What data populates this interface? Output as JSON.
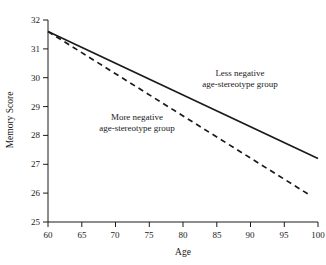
{
  "chart_data": {
    "type": "line",
    "title": "",
    "xlabel": "Age",
    "ylabel": "Memory Score",
    "xlim": [
      60,
      100
    ],
    "ylim": [
      25,
      32
    ],
    "xticks": [
      60,
      65,
      70,
      75,
      80,
      85,
      90,
      95,
      100
    ],
    "xtick_labels": [
      "60",
      "65",
      "70",
      "75",
      "80",
      "85",
      "90",
      "95",
      "100"
    ],
    "yticks": [
      25,
      26,
      27,
      28,
      29,
      30,
      31,
      32
    ],
    "ytick_labels": [
      "25",
      "26",
      "27",
      "28",
      "29",
      "30",
      "31",
      "32"
    ],
    "grid": false,
    "legend_position": "inline-annotation",
    "series": [
      {
        "name": "Less negative age-stereotype group",
        "label_line1": "Less negative",
        "label_line2": "age-stereotype group",
        "style": "solid",
        "color": "#1a1a1a",
        "x": [
          60,
          100
        ],
        "values": [
          31.6,
          27.2
        ]
      },
      {
        "name": "More negative age-stereotype group",
        "label_line1": "More negative",
        "label_line2": "age-stereotype group",
        "style": "dashed",
        "color": "#1a1a1a",
        "x": [
          60,
          99
        ],
        "values": [
          31.6,
          25.9
        ]
      }
    ]
  },
  "axes": {
    "x_title": "Age",
    "y_title": "Memory Score"
  },
  "colors": {
    "background": "#ffffff",
    "axis": "#1a1a1a",
    "ink": "#1a1a1a"
  }
}
